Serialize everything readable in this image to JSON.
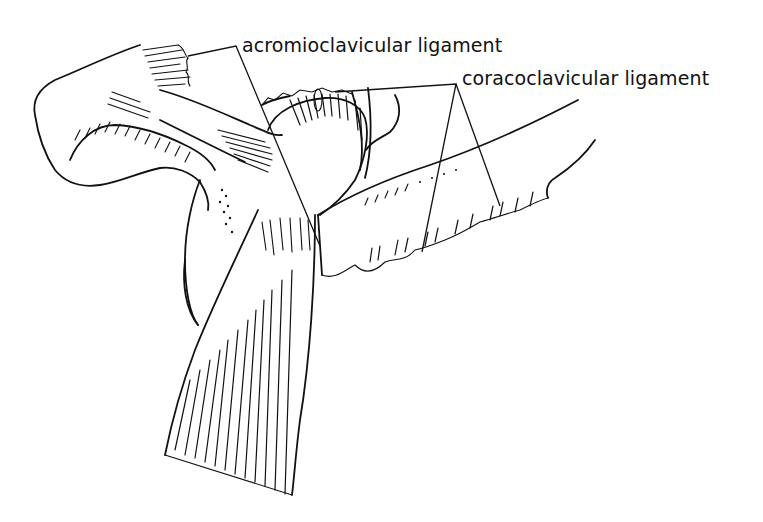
{
  "figure": {
    "type": "anatomical line drawing",
    "background_color": "#ffffff",
    "ink_color": "#111111"
  },
  "labels": [
    {
      "id": "acromioclavicular",
      "text": "acromioclavicular ligament",
      "leader_targets": 2
    },
    {
      "id": "coracoclavicular",
      "text": "coracoclavicular ligament",
      "leader_targets": 3
    }
  ]
}
